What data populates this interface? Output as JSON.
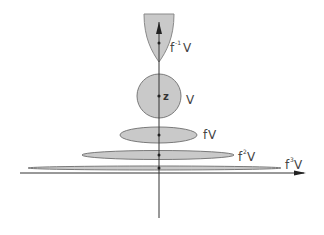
{
  "diagram": {
    "colors": {
      "background": "#ffffff",
      "fill": "#c9c9c9",
      "stroke": "#7a7a7a",
      "axis": "#333333",
      "text": "#444444"
    },
    "point_label": "z",
    "regions": [
      {
        "id": "preimage",
        "base": "f",
        "exponent": "-1",
        "suffix": "V",
        "shape": "parabola"
      },
      {
        "id": "v",
        "base": "",
        "exponent": "",
        "suffix": "V",
        "shape": "circle"
      },
      {
        "id": "image1",
        "base": "f",
        "exponent": "",
        "suffix": "V",
        "shape": "ellipse"
      },
      {
        "id": "image2",
        "base": "f",
        "exponent": "2",
        "suffix": "V",
        "shape": "ellipse"
      },
      {
        "id": "image3",
        "base": "f",
        "exponent": "3",
        "suffix": "V",
        "shape": "ellipse"
      }
    ]
  }
}
